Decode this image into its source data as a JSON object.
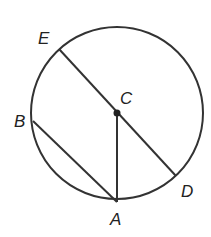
{
  "diagram": {
    "type": "circle-geometry",
    "circle": {
      "cx": 117,
      "cy": 113,
      "r": 86,
      "stroke": "#333333"
    },
    "points": {
      "E": {
        "label": "E",
        "x": 59,
        "y": 49,
        "label_x": 38,
        "label_y": 44
      },
      "C": {
        "label": "C",
        "x": 117,
        "y": 113,
        "label_x": 120,
        "label_y": 104
      },
      "B": {
        "label": "B",
        "x": 33,
        "y": 121,
        "label_x": 14,
        "label_y": 127
      },
      "A": {
        "label": "A",
        "x": 117,
        "y": 202,
        "label_x": 110,
        "label_y": 225
      },
      "D": {
        "label": "D",
        "x": 176,
        "y": 176,
        "label_x": 181,
        "label_y": 197
      }
    },
    "segments": [
      {
        "name": "diameter-ED",
        "from": "E",
        "to": "D"
      },
      {
        "name": "chord-BA",
        "from": "B",
        "to": "A"
      },
      {
        "name": "radius-CA",
        "from": "C",
        "to": "A"
      }
    ]
  }
}
